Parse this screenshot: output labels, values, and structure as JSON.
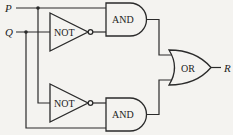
{
  "diagram": {
    "type": "logic-circuit",
    "inputs": [
      {
        "id": "P",
        "label": "P"
      },
      {
        "id": "Q",
        "label": "Q"
      }
    ],
    "outputs": [
      {
        "id": "R",
        "label": "R"
      }
    ],
    "gates": [
      {
        "id": "not1",
        "label": "NOT",
        "input": "Q"
      },
      {
        "id": "and1",
        "label": "AND",
        "inputs": [
          "P",
          "not1"
        ]
      },
      {
        "id": "not2",
        "label": "NOT",
        "input": "P"
      },
      {
        "id": "and2",
        "label": "AND",
        "inputs": [
          "not2",
          "Q"
        ]
      },
      {
        "id": "or1",
        "label": "OR",
        "inputs": [
          "and1",
          "and2"
        ],
        "output": "R"
      }
    ],
    "colors": {
      "line": "#2a2a2a",
      "background": "#f4f3f0"
    }
  }
}
